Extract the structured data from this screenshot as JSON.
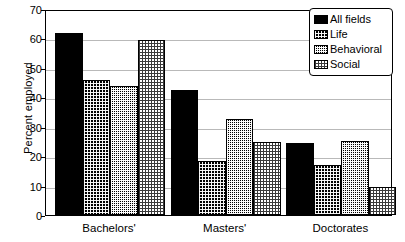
{
  "chart_data": {
    "type": "bar",
    "title": "",
    "subtitle": "",
    "xlabel": "",
    "ylabel": "Percent employed",
    "ylim": [
      0,
      70
    ],
    "yticks": [
      0,
      10,
      20,
      30,
      40,
      50,
      60,
      70
    ],
    "grid": true,
    "legend_position": "top-right",
    "categories": [
      "Bachelors'",
      "Masters'",
      "Doctorates"
    ],
    "series": [
      {
        "name": "All fields",
        "values": [
          62.0,
          42.5,
          24.5
        ],
        "pattern": "solid-black",
        "color": "#000000"
      },
      {
        "name": "Life",
        "values": [
          46.0,
          18.5,
          17.0
        ],
        "pattern": "dark-dither",
        "color": "#333333"
      },
      {
        "name": "Behavioral",
        "values": [
          44.0,
          32.5,
          25.0
        ],
        "pattern": "medium-dither",
        "color": "#6b6b6b"
      },
      {
        "name": "Social",
        "values": [
          59.5,
          24.8,
          9.5
        ],
        "pattern": "light-dither",
        "color": "#b8b8b8"
      }
    ]
  },
  "legend": {
    "items": [
      {
        "label": "All fields"
      },
      {
        "label": "Life"
      },
      {
        "label": "Behavioral"
      },
      {
        "label": "Social"
      }
    ]
  },
  "axes": {
    "y_label": "Percent employed",
    "y_tick_labels": [
      "0",
      "10",
      "20",
      "30",
      "40",
      "50",
      "60",
      "70"
    ],
    "x_tick_labels": [
      "Bachelors'",
      "Masters'",
      "Doctorates"
    ]
  }
}
